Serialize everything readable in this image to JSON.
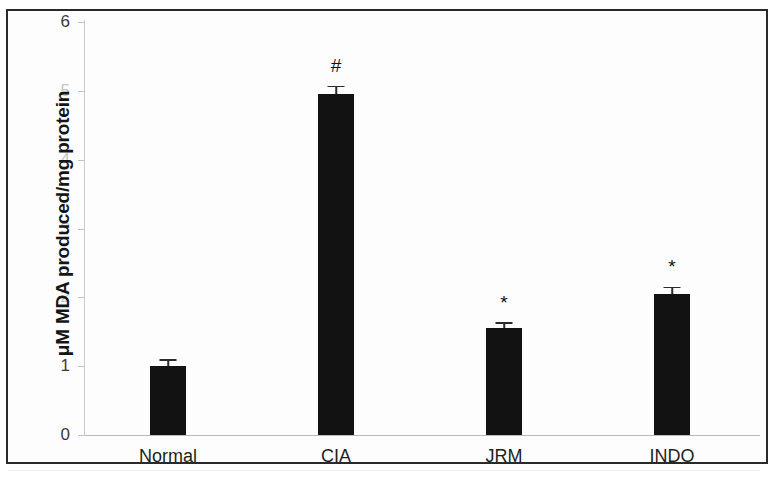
{
  "chart_data": {
    "type": "bar",
    "title": "",
    "subtitle": "",
    "xlabel": "",
    "ylabel": "μM MDA produced/mg protein",
    "categories": [
      "Normal",
      "CIA",
      "JRM",
      "INDO"
    ],
    "values": [
      1.0,
      4.95,
      1.55,
      2.05
    ],
    "errors": [
      0.08,
      0.1,
      0.07,
      0.08
    ],
    "annotations": [
      "",
      "#",
      "*",
      "*"
    ],
    "ylim": [
      0,
      6
    ],
    "yticks": [
      0,
      1,
      2,
      3,
      4,
      5,
      6
    ],
    "ytick_labels": [
      "0",
      "1",
      "2",
      "3",
      "4",
      "5",
      "6"
    ],
    "grid": false,
    "legend": null,
    "bar_color": "#121212",
    "series": [
      {
        "name": "MDA produced",
        "values": [
          1.0,
          4.95,
          1.55,
          2.05
        ]
      }
    ]
  },
  "axes": {
    "y_title": "μM MDA produced/mg protein",
    "ticks": [
      {
        "label": "6",
        "value": 6,
        "visible": true
      },
      {
        "label": "5",
        "value": 5,
        "visible": false
      },
      {
        "label": "4",
        "value": 4,
        "visible": false
      },
      {
        "label": "3",
        "value": 3,
        "visible": false
      },
      {
        "label": "2",
        "value": 2,
        "visible": false
      },
      {
        "label": "1",
        "value": 1,
        "visible": true
      },
      {
        "label": "0",
        "value": 0,
        "visible": true
      }
    ]
  },
  "bars": [
    {
      "category": "Normal",
      "value": 1.0,
      "error": 0.08,
      "marker": ""
    },
    {
      "category": "CIA",
      "value": 4.95,
      "error": 0.1,
      "marker": "#"
    },
    {
      "category": "JRM",
      "value": 1.55,
      "error": 0.07,
      "marker": "*"
    },
    {
      "category": "INDO",
      "value": 2.05,
      "error": 0.08,
      "marker": "*"
    }
  ],
  "colors": {
    "bar": "#121212",
    "axis": "#c2c2c2",
    "text": "#1f1f1f",
    "frame": "#2a2a2a"
  }
}
